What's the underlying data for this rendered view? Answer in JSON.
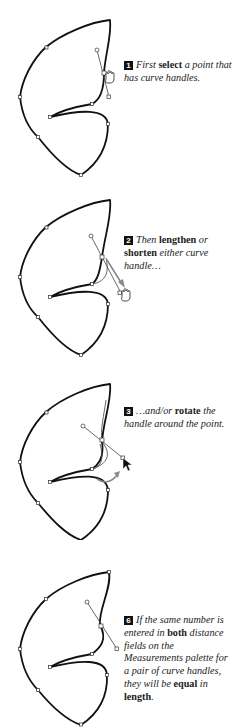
{
  "figure": {
    "steps": [
      {
        "number": "1",
        "parts": [
          {
            "t": "First ",
            "bold": false
          },
          {
            "t": "select",
            "bold": true
          },
          {
            "t": " a point that has curve handles.",
            "bold": false
          }
        ]
      },
      {
        "number": "2",
        "parts": [
          {
            "t": "Then ",
            "bold": false
          },
          {
            "t": "lengthen",
            "bold": true
          },
          {
            "t": " or ",
            "bold": false
          },
          {
            "t": "shorten",
            "bold": true
          },
          {
            "t": " either curve handle…",
            "bold": false
          }
        ]
      },
      {
        "number": "3",
        "parts": [
          {
            "t": "…and/or ",
            "bold": false
          },
          {
            "t": "rotate",
            "bold": true
          },
          {
            "t": " the handle around the point.",
            "bold": false
          }
        ]
      },
      {
        "number": "6",
        "parts": [
          {
            "t": "If the same number is entered in ",
            "bold": false
          },
          {
            "t": "both",
            "bold": true
          },
          {
            "t": " distance fields on the Measurements palette for a pair of curve handles, they will be ",
            "bold": false
          },
          {
            "t": "equal",
            "bold": true
          },
          {
            "t": " in ",
            "bold": false
          },
          {
            "t": "length",
            "bold": true
          },
          {
            "t": ".",
            "bold": false
          }
        ]
      }
    ],
    "icons": {
      "step1_cursor": "grabber-hand-icon",
      "step2_cursor": "grabber-hand-icon",
      "step3_cursor": "arrow-pointer-icon",
      "step2_arrow": "drag-direction-arrow-icon",
      "step3_arrow": "rotate-arrow-icon"
    },
    "colors": {
      "path": "#111111",
      "handle": "#444444",
      "arrow": "#8a8a8a",
      "badge": "#111111"
    }
  }
}
